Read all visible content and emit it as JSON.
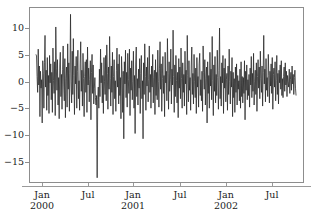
{
  "chart_data": {
    "type": "line",
    "title": "",
    "subtitle": "",
    "xlabel": "",
    "ylabel": "",
    "xlim": [
      "2000-01-01",
      "2002-10-15"
    ],
    "ylim": [
      -19,
      14
    ],
    "grid": false,
    "legend": null,
    "line_color": "#2b2b2b",
    "line_width": 0.8,
    "background": "#ffffff",
    "frame_color": "#8d8d8d",
    "y_ticks": [
      10,
      5,
      0,
      -5,
      -10,
      -15
    ],
    "y_tick_labels": [
      "10",
      "5",
      "0",
      "−5",
      "−10",
      "−15"
    ],
    "x_ticks": [
      "2000-01",
      "2000-07",
      "2001-01",
      "2001-07",
      "2002-01",
      "2002-07"
    ],
    "x_tick_labels": [
      {
        "month": "Jan",
        "year": "2000"
      },
      {
        "month": "Jul",
        "year": ""
      },
      {
        "month": "Jan",
        "year": "2001"
      },
      {
        "month": "Jul",
        "year": ""
      },
      {
        "month": "Jan",
        "year": "2002"
      },
      {
        "month": "Jul",
        "year": ""
      }
    ],
    "series": [
      {
        "name": "series-1",
        "values": [
          5.2,
          4.9,
          1.0,
          -2.0,
          6.2,
          -0.6,
          3.0,
          -6.6,
          2.0,
          -1.2,
          0.4,
          -7.8,
          4.0,
          1.5,
          -5.0,
          3.6,
          8.8,
          -1.0,
          2.2,
          -5.4,
          4.6,
          -2.6,
          1.2,
          -6.0,
          5.0,
          -0.2,
          3.4,
          -3.4,
          1.8,
          -5.8,
          6.4,
          0.2,
          -2.2,
          3.8,
          -6.4,
          10.4,
          2.6,
          -1.6,
          4.2,
          -4.4,
          0.8,
          -7.0,
          3.2,
          5.6,
          -2.8,
          1.4,
          -5.2,
          2.4,
          6.8,
          -0.8,
          -3.6,
          4.4,
          -6.8,
          0.6,
          2.8,
          -4.8,
          7.2,
          -1.4,
          3.6,
          -5.6,
          1.6,
          12.8,
          0.0,
          -4.0,
          5.8,
          -2.4,
          8.2,
          1.2,
          -6.2,
          3.0,
          -0.4,
          4.8,
          -5.0,
          2.0,
          6.0,
          -3.2,
          0.2,
          -5.4,
          3.4,
          7.6,
          -1.8,
          2.2,
          -4.6,
          5.4,
          0.6,
          -6.6,
          1.0,
          3.8,
          -2.0,
          4.2,
          -5.8,
          6.6,
          -0.6,
          2.6,
          -3.8,
          0.4,
          4.0,
          -7.2,
          1.8,
          5.2,
          -2.2,
          3.2,
          -4.2,
          -1.2,
          0.8,
          -3.0,
          -4.4,
          -2.6,
          -18.2,
          -3.4,
          -1.0,
          -5.0,
          2.4,
          -2.8,
          6.2,
          -0.2,
          3.6,
          -4.0,
          1.2,
          -6.0,
          4.6,
          0.0,
          -2.4,
          5.0,
          -3.6,
          7.0,
          1.6,
          -5.2,
          2.8,
          -1.4,
          8.6,
          0.6,
          -4.6,
          3.0,
          -2.0,
          5.6,
          -6.2,
          1.0,
          4.2,
          -3.2,
          0.2,
          -5.6,
          2.2,
          6.4,
          -1.0,
          3.4,
          -4.2,
          5.2,
          -2.6,
          0.8,
          -7.0,
          4.8,
          1.4,
          -5.8,
          2.0,
          -10.8,
          3.8,
          -0.4,
          6.0,
          -3.0,
          1.8,
          -4.8,
          5.4,
          0.4,
          -2.2,
          6.2,
          -6.4,
          2.6,
          -1.6,
          4.0,
          -3.4,
          0.0,
          5.8,
          -5.0,
          1.2,
          -9.8,
          3.2,
          6.6,
          -2.8,
          0.6,
          -4.4,
          2.4,
          -1.2,
          4.4,
          -6.0,
          1.6,
          5.0,
          -3.2,
          0.2,
          -10.8,
          3.6,
          -2.4,
          7.2,
          1.0,
          -5.4,
          2.8,
          -0.8,
          4.6,
          -3.8,
          0.4,
          6.8,
          -2.0,
          1.4,
          -5.0,
          3.0,
          -1.0,
          5.2,
          -4.0,
          0.8,
          2.2,
          -6.2,
          4.2,
          -2.6,
          1.8,
          -3.4,
          6.0,
          0.0,
          -4.8,
          2.6,
          7.6,
          -1.4,
          3.4,
          -5.6,
          0.6,
          4.8,
          -2.2,
          1.2,
          -6.6,
          5.6,
          -0.2,
          2.0,
          -3.6,
          8.2,
          1.6,
          -5.2,
          3.8,
          -1.8,
          0.4,
          6.2,
          -4.2,
          2.4,
          -0.6,
          9.8,
          1.0,
          -5.8,
          3.2,
          -2.8,
          5.0,
          0.2,
          -4.0,
          1.8,
          -6.8,
          4.4,
          -1.2,
          2.8,
          -3.2,
          6.4,
          0.6,
          -5.0,
          3.6,
          -2.0,
          1.4,
          -4.6,
          5.8,
          -0.4,
          2.2,
          -6.2,
          8.8,
          1.2,
          -3.8,
          4.0,
          -1.6,
          0.8,
          -5.4,
          3.0,
          6.6,
          -2.4,
          1.6,
          -4.2,
          5.2,
          0.0,
          -3.0,
          2.6,
          -6.0,
          4.6,
          -1.0,
          1.0,
          -4.8,
          3.4,
          5.4,
          -2.6,
          0.4,
          -3.6,
          2.0,
          -5.6,
          6.8,
          1.8,
          -1.4,
          4.2,
          -4.4,
          0.6,
          2.8,
          -7.8,
          3.8,
          -2.2,
          1.2,
          -5.0,
          5.6,
          -0.8,
          2.4,
          -3.4,
          8.6,
          0.2,
          -6.4,
          3.2,
          -1.8,
          4.8,
          -4.0,
          1.4,
          -2.6,
          6.0,
          0.8,
          -5.2,
          2.2,
          10.2,
          -3.2,
          1.0,
          -4.6,
          3.6,
          -0.2,
          5.0,
          -6.0,
          2.6,
          -1.2,
          4.4,
          -3.8,
          0.4,
          1.6,
          -5.4,
          3.0,
          -2.4,
          6.2,
          0.0,
          -4.2,
          2.0,
          -1.0,
          4.6,
          -6.6,
          1.8,
          -3.0,
          0.6,
          -5.8,
          2.8,
          -2.0,
          3.4,
          -4.4,
          1.2,
          -1.4,
          0.2,
          -3.6,
          2.4,
          -5.0,
          3.8,
          -2.8,
          1.0,
          -4.0,
          0.8,
          -2.2,
          4.0,
          -7.2,
          2.0,
          -1.6,
          3.2,
          -3.4,
          0.4,
          -2.6,
          1.4,
          -4.8,
          2.6,
          -0.6,
          4.8,
          -3.0,
          1.6,
          -1.8,
          5.4,
          -4.4,
          0.0,
          2.2,
          -2.4,
          3.6,
          -5.6,
          1.0,
          4.2,
          -1.2,
          2.8,
          -3.2,
          5.8,
          0.6,
          -2.0,
          3.0,
          -4.6,
          1.8,
          8.8,
          -0.4,
          2.4,
          -3.8,
          4.4,
          -1.6,
          0.8,
          -2.8,
          5.2,
          1.2,
          -4.0,
          2.0,
          -0.8,
          3.4,
          -2.2,
          4.6,
          -5.2,
          1.4,
          2.6,
          -1.0,
          3.8,
          -3.6,
          0.2,
          5.0,
          -2.4,
          1.6,
          -4.2,
          2.2,
          -0.2,
          3.2,
          -1.4,
          4.0,
          -2.6,
          0.6,
          -3.0,
          1.0,
          2.8,
          -1.8,
          3.6,
          -0.6,
          2.0,
          -2.8,
          1.2,
          0.0,
          -1.0,
          2.4,
          -2.2,
          0.4,
          1.8,
          -1.6,
          3.0,
          -0.4,
          1.4,
          -2.4,
          0.8,
          2.2,
          -1.2,
          -2.6
        ]
      }
    ],
    "n_points": 460,
    "data_min": -18.2,
    "data_max": 12.8
  }
}
